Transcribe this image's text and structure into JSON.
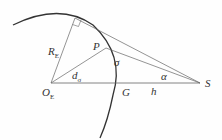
{
  "diagram": {
    "type": "geometry",
    "labels": {
      "radius": {
        "main": "R",
        "sub": "E"
      },
      "center": {
        "main": "O",
        "sub": "E"
      },
      "point_p": "P",
      "sigma": "σ",
      "d_sigma": {
        "main": "d",
        "sub": "σ"
      },
      "alpha": "α",
      "ground": "G",
      "height": "h",
      "satellite": "S"
    },
    "colors": {
      "arc": "#333333",
      "lines": "#555555",
      "text": "#333333"
    }
  }
}
